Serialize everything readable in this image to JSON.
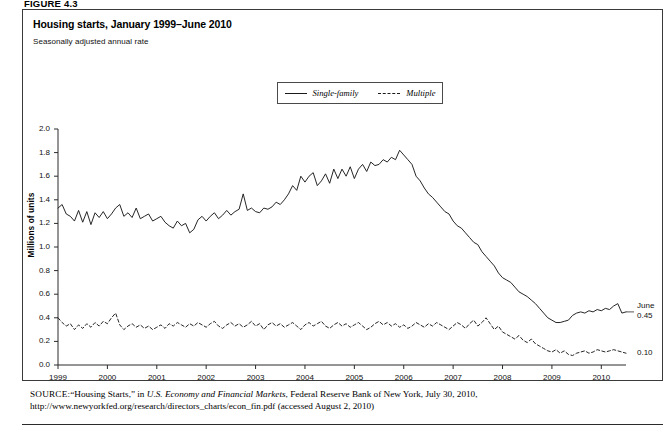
{
  "figure": {
    "number": "FIGURE 4.3"
  },
  "chart": {
    "title": "Housing starts, January 1999–June 2010",
    "subtitle": "Seasonally adjusted annual rate",
    "ylabel": "Millions of units",
    "legend": [
      {
        "label": "Single-family",
        "style": "solid"
      },
      {
        "label": "Multiple",
        "style": "dashed"
      }
    ],
    "end_labels": {
      "single_family_month": "June",
      "single_family_value": "0.45",
      "multiple_value": "0.10"
    }
  },
  "source": {
    "prefix": "SOURCE:",
    "text_1": "“Housing Starts,” in ",
    "italic_1": "U.S. Economy and Financial Markets",
    "text_2": ", Federal Reserve Bank of New York, July 30, 2010, http://www.newyorkfed.org/research/directors_charts/econ_fin.pdf (accessed August 2, 2010)"
  },
  "chart_data": {
    "type": "line",
    "title": "Housing starts, January 1999–June 2010",
    "subtitle": "Seasonally adjusted annual rate",
    "xlabel": "",
    "ylabel": "Millions of units",
    "ylim": [
      0.0,
      2.0
    ],
    "yticks": [
      "0.0",
      "0.2",
      "0.4",
      "0.6",
      "0.8",
      "1.0",
      "1.2",
      "1.4",
      "1.6",
      "1.8",
      "2.0"
    ],
    "xticks": [
      "1999",
      "2000",
      "2001",
      "2002",
      "2003",
      "2004",
      "2005",
      "2006",
      "2007",
      "2008",
      "2009",
      "2010"
    ],
    "xlim_months": [
      "1999-01",
      "2010-06"
    ],
    "grid": false,
    "legend_position": "top-center",
    "annotations": [
      {
        "text": "June 0.45",
        "series": "Single-family",
        "at": "2010-06",
        "value": 0.45
      },
      {
        "text": "0.10",
        "series": "Multiple",
        "at": "2010-06",
        "value": 0.1
      }
    ],
    "series": [
      {
        "name": "Single-family",
        "style": "solid",
        "color": "#1a1a1a",
        "values": [
          1.33,
          1.36,
          1.28,
          1.26,
          1.22,
          1.31,
          1.21,
          1.3,
          1.19,
          1.29,
          1.25,
          1.3,
          1.24,
          1.28,
          1.33,
          1.36,
          1.26,
          1.29,
          1.25,
          1.33,
          1.24,
          1.26,
          1.28,
          1.22,
          1.24,
          1.26,
          1.21,
          1.18,
          1.16,
          1.22,
          1.18,
          1.2,
          1.12,
          1.15,
          1.23,
          1.26,
          1.22,
          1.26,
          1.29,
          1.24,
          1.27,
          1.31,
          1.27,
          1.3,
          1.32,
          1.45,
          1.31,
          1.33,
          1.3,
          1.29,
          1.33,
          1.32,
          1.34,
          1.38,
          1.36,
          1.4,
          1.45,
          1.52,
          1.48,
          1.6,
          1.55,
          1.6,
          1.63,
          1.52,
          1.56,
          1.62,
          1.54,
          1.66,
          1.58,
          1.66,
          1.6,
          1.68,
          1.58,
          1.66,
          1.7,
          1.64,
          1.72,
          1.69,
          1.7,
          1.74,
          1.72,
          1.76,
          1.74,
          1.82,
          1.78,
          1.74,
          1.7,
          1.6,
          1.56,
          1.5,
          1.45,
          1.42,
          1.38,
          1.34,
          1.3,
          1.28,
          1.22,
          1.18,
          1.16,
          1.12,
          1.08,
          1.04,
          1.02,
          0.96,
          0.92,
          0.88,
          0.84,
          0.78,
          0.74,
          0.72,
          0.7,
          0.66,
          0.62,
          0.6,
          0.58,
          0.55,
          0.52,
          0.48,
          0.44,
          0.4,
          0.38,
          0.36,
          0.36,
          0.37,
          0.38,
          0.42,
          0.44,
          0.45,
          0.44,
          0.46,
          0.45,
          0.47,
          0.46,
          0.48,
          0.47,
          0.5,
          0.52,
          0.44,
          0.45
        ]
      },
      {
        "name": "Multiple",
        "style": "dashed",
        "color": "#1a1a1a",
        "values": [
          0.4,
          0.36,
          0.33,
          0.35,
          0.3,
          0.34,
          0.31,
          0.35,
          0.32,
          0.36,
          0.33,
          0.37,
          0.35,
          0.4,
          0.44,
          0.34,
          0.3,
          0.33,
          0.35,
          0.32,
          0.34,
          0.31,
          0.33,
          0.3,
          0.32,
          0.34,
          0.31,
          0.35,
          0.33,
          0.36,
          0.34,
          0.32,
          0.35,
          0.33,
          0.36,
          0.34,
          0.32,
          0.35,
          0.37,
          0.33,
          0.31,
          0.34,
          0.36,
          0.33,
          0.35,
          0.32,
          0.34,
          0.37,
          0.33,
          0.35,
          0.3,
          0.34,
          0.36,
          0.33,
          0.35,
          0.32,
          0.34,
          0.36,
          0.33,
          0.3,
          0.34,
          0.36,
          0.33,
          0.35,
          0.37,
          0.33,
          0.31,
          0.34,
          0.36,
          0.33,
          0.35,
          0.32,
          0.34,
          0.36,
          0.33,
          0.3,
          0.32,
          0.35,
          0.37,
          0.34,
          0.36,
          0.33,
          0.35,
          0.32,
          0.34,
          0.31,
          0.33,
          0.36,
          0.34,
          0.32,
          0.35,
          0.33,
          0.36,
          0.34,
          0.32,
          0.3,
          0.33,
          0.36,
          0.34,
          0.31,
          0.35,
          0.38,
          0.33,
          0.36,
          0.4,
          0.35,
          0.3,
          0.33,
          0.28,
          0.26,
          0.24,
          0.22,
          0.25,
          0.21,
          0.19,
          0.22,
          0.18,
          0.16,
          0.14,
          0.12,
          0.11,
          0.13,
          0.1,
          0.12,
          0.09,
          0.08,
          0.1,
          0.11,
          0.12,
          0.1,
          0.11,
          0.13,
          0.12,
          0.11,
          0.12,
          0.13,
          0.12,
          0.11,
          0.1
        ]
      }
    ]
  }
}
